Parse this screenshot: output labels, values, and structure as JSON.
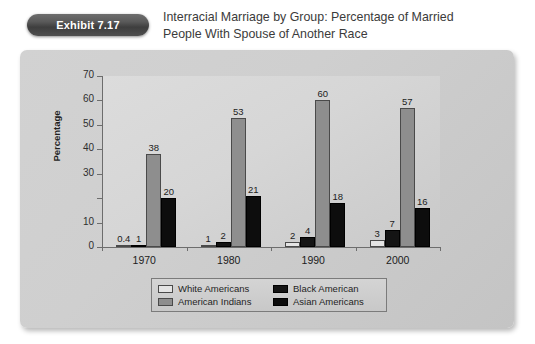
{
  "header": {
    "exhibit_badge": "Exhibit 7.17",
    "title": "Interracial Marriage by Group: Percentage of Married People With Spouse of Another Race"
  },
  "chart_data": {
    "type": "bar",
    "title": "Interracial Marriage by Group: Percentage of Married People With Spouse of Another Race",
    "xlabel": "",
    "ylabel": "Percentage",
    "categories": [
      "1970",
      "1980",
      "1990",
      "2000"
    ],
    "ylim": [
      0,
      70
    ],
    "yticks": [
      0,
      10,
      20,
      30,
      40,
      50,
      60,
      70
    ],
    "ytick_labels": [
      "0",
      "10",
      "",
      "30",
      "40",
      "50",
      "60",
      "70"
    ],
    "grid": false,
    "legend_position": "bottom",
    "series": [
      {
        "name": "White Americans",
        "color": "#e4e4e4",
        "values": [
          0.4,
          1,
          2,
          3
        ],
        "labels": [
          "0.4",
          "1",
          "2",
          "3"
        ]
      },
      {
        "name": "Black American",
        "color": "#141414",
        "values": [
          1,
          2,
          4,
          7
        ],
        "labels": [
          "1",
          "2",
          "4",
          "7"
        ]
      },
      {
        "name": "American Indians",
        "color": "#8e8e8e",
        "values": [
          38,
          53,
          60,
          57
        ],
        "labels": [
          "38",
          "53",
          "60",
          "57"
        ]
      },
      {
        "name": "Asian Americans",
        "color": "#0d0d0d",
        "values": [
          20,
          21,
          18,
          16
        ],
        "labels": [
          "20",
          "21",
          "18",
          "16"
        ]
      }
    ]
  },
  "legend": {
    "entries": [
      {
        "label": "White Americans",
        "swatch": "c0"
      },
      {
        "label": "Black American",
        "swatch": "c1"
      },
      {
        "label": "American Indians",
        "swatch": "c2"
      },
      {
        "label": "Asian Americans",
        "swatch": "c3"
      }
    ]
  }
}
